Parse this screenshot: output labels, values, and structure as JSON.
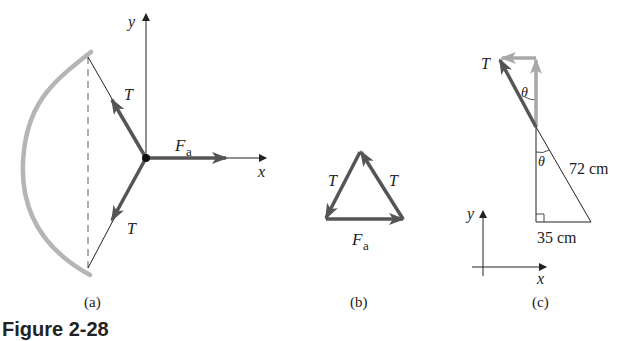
{
  "figure": {
    "caption": "Figure 2-28",
    "panels": [
      {
        "id": "a",
        "label": "(a)",
        "axes": {
          "x": "x",
          "y": "y"
        },
        "forces": {
          "tension": "T",
          "applied": "F",
          "applied_sub": "a"
        }
      },
      {
        "id": "b",
        "label": "(b)",
        "forces": {
          "left": "T",
          "right": "T",
          "bottom": "F",
          "bottom_sub": "a"
        }
      },
      {
        "id": "c",
        "label": "(c)",
        "tension": "T",
        "angle": "θ",
        "hypotenuse": "72 cm",
        "base": "35 cm",
        "axes": {
          "x": "x",
          "y": "y"
        }
      }
    ]
  },
  "colors": {
    "force": "#555555",
    "component": "#a8a8a8",
    "bow": "#b5b5b5",
    "line": "#222222"
  }
}
